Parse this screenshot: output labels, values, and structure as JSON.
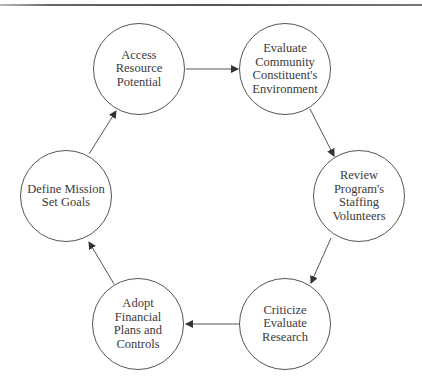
{
  "diagram": {
    "type": "cycle",
    "nodes": [
      {
        "id": "access",
        "label": "Access\nResource\nPotential",
        "cx": 139,
        "cy": 69
      },
      {
        "id": "evaluate",
        "label": "Evaluate\nCommunity\nConstituent's\nEnvironment",
        "cx": 285,
        "cy": 69
      },
      {
        "id": "review",
        "label": "Review\nProgram's\nStaffing\nVolunteers",
        "cx": 359,
        "cy": 196
      },
      {
        "id": "criticize",
        "label": "Criticize\nEvaluate\nResearch",
        "cx": 285,
        "cy": 324
      },
      {
        "id": "adopt",
        "label": "Adopt\nFinancial\nPlans and\nControls",
        "cx": 138,
        "cy": 324
      },
      {
        "id": "define",
        "label": "Define Mission\nSet Goals",
        "cx": 66,
        "cy": 196
      }
    ],
    "edges": [
      {
        "from": "access",
        "to": "evaluate"
      },
      {
        "from": "evaluate",
        "to": "review"
      },
      {
        "from": "review",
        "to": "criticize"
      },
      {
        "from": "criticize",
        "to": "adopt"
      },
      {
        "from": "adopt",
        "to": "define"
      },
      {
        "from": "define",
        "to": "access"
      }
    ],
    "colors": {
      "stroke": "#555555",
      "text": "#3a3a3a",
      "background": "#ffffff"
    }
  }
}
